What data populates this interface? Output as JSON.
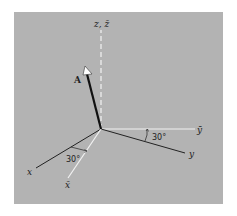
{
  "diagram": {
    "type": "3d-coordinate-axes",
    "colors": {
      "background": "#ffffff",
      "panel": "#b3b3b3",
      "original_axes": "#222222",
      "rotated_axes": "#f2f2f2",
      "vector": "#111111",
      "arrowhead": "#ffffff"
    },
    "axes": {
      "z": {
        "label": "z, z̄",
        "style": "dashed",
        "color": "white"
      },
      "x": {
        "label": "x",
        "style": "solid",
        "color": "black"
      },
      "y": {
        "label": "y",
        "style": "solid",
        "color": "black"
      },
      "x_bar": {
        "label": "x̄",
        "style": "solid",
        "color": "white"
      },
      "y_bar": {
        "label": "ȳ",
        "style": "solid",
        "color": "white"
      }
    },
    "vector": {
      "label": "A"
    },
    "angles": [
      {
        "between": [
          "ȳ",
          "y"
        ],
        "label": "30°"
      },
      {
        "between": [
          "x",
          "x̄"
        ],
        "label": "30°"
      }
    ]
  }
}
